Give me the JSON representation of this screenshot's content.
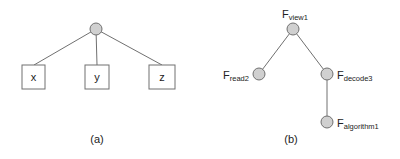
{
  "figure_a": {
    "caption": "(a)",
    "root": {
      "shape": "circle"
    },
    "leaves": [
      {
        "label": "x"
      },
      {
        "label": "y"
      },
      {
        "label": "z"
      }
    ]
  },
  "figure_b": {
    "caption": "(b)",
    "nodes": {
      "view": {
        "base": "F",
        "sub": "view1"
      },
      "read": {
        "base": "F",
        "sub": "read2"
      },
      "decode": {
        "base": "F",
        "sub": "decode3"
      },
      "algorithm": {
        "base": "F",
        "sub": "algorithm1"
      }
    },
    "edges": [
      [
        "view",
        "read"
      ],
      [
        "view",
        "decode"
      ],
      [
        "decode",
        "algorithm"
      ]
    ]
  },
  "colors": {
    "node_fill": "#d0d0d0",
    "node_stroke": "#707070",
    "edge": "#707070",
    "box_stroke": "#707070",
    "text": "#222222"
  }
}
